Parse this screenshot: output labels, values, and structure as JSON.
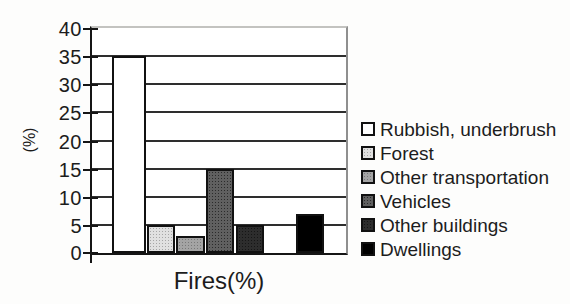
{
  "chart_data": {
    "type": "bar",
    "title": "",
    "xlabel": "Fires(%)",
    "ylabel": "(%)",
    "ylim": [
      0,
      40
    ],
    "yticks": [
      0,
      5,
      10,
      15,
      20,
      25,
      30,
      35,
      40
    ],
    "grid": true,
    "legend_position": "right",
    "categories": [
      "Fires(%)"
    ],
    "series": [
      {
        "name": "Rubbish, underbrush",
        "value": 35,
        "color": "#ffffff",
        "pattern": "none"
      },
      {
        "name": "Forest",
        "value": 5,
        "color": "#e0e0e0",
        "pattern": "dots-fine-light"
      },
      {
        "name": "Other transportation",
        "value": 3,
        "color": "#a4a4a4",
        "pattern": "dots-fine-med"
      },
      {
        "name": "Vehicles",
        "value": 15,
        "color": "#606060",
        "pattern": "dots-dark"
      },
      {
        "name": "Other buildings",
        "value": 5,
        "color": "#2d2d2d",
        "pattern": "dots-darker"
      },
      {
        "name": "Dwellings",
        "value": 7,
        "color": "#000000",
        "pattern": "none"
      }
    ]
  },
  "style": {
    "grid_color": "#2e2e2e",
    "axis_color": "#151515",
    "text_color": "#1c1c1c"
  }
}
